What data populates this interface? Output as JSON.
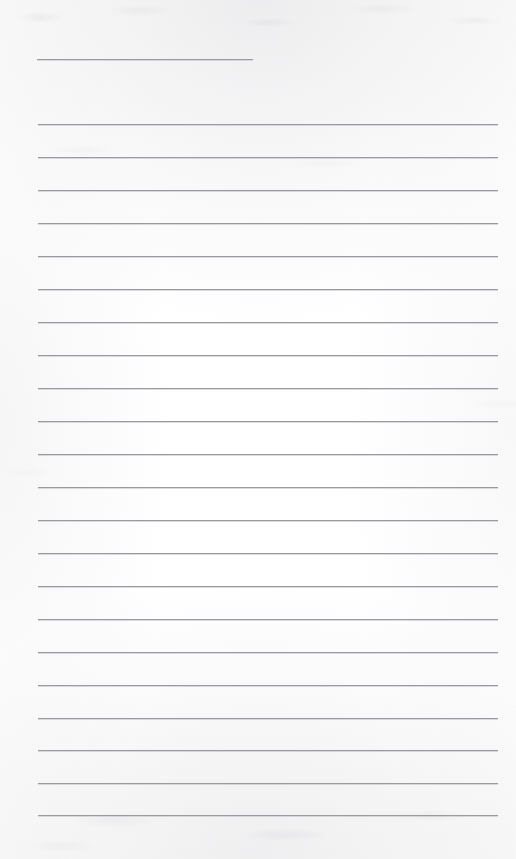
{
  "document": {
    "kind": "scanned-lined-paper",
    "title": "Blank ruled notepaper scan",
    "text_content": "",
    "handwriting": "none",
    "page_width": 516,
    "page_height": 859,
    "background_color": "#fdfdfc",
    "rule_color": "#9a9a9f",
    "rule_thickness_px": 1
  },
  "layout": {
    "left_margin_x": 38,
    "right_margin_x": 498,
    "top_margin_height": 59,
    "bottom_margin_height": 44,
    "line_spacing_px": 33,
    "full_width_line_count": 22,
    "short_line_count": 1
  },
  "rules": {
    "short": [
      {
        "x": 37,
        "y": 59,
        "width": 216
      }
    ],
    "full": [
      {
        "x": 38,
        "y": 124,
        "width": 460
      },
      {
        "x": 38,
        "y": 157,
        "width": 460
      },
      {
        "x": 38,
        "y": 190,
        "width": 460
      },
      {
        "x": 38,
        "y": 223,
        "width": 460
      },
      {
        "x": 38,
        "y": 256,
        "width": 460
      },
      {
        "x": 38,
        "y": 289,
        "width": 460
      },
      {
        "x": 38,
        "y": 322,
        "width": 460
      },
      {
        "x": 38,
        "y": 355,
        "width": 460
      },
      {
        "x": 38,
        "y": 388,
        "width": 460
      },
      {
        "x": 38,
        "y": 421,
        "width": 460
      },
      {
        "x": 38,
        "y": 454,
        "width": 460
      },
      {
        "x": 38,
        "y": 487,
        "width": 460
      },
      {
        "x": 38,
        "y": 520,
        "width": 460
      },
      {
        "x": 38,
        "y": 553,
        "width": 460
      },
      {
        "x": 38,
        "y": 586,
        "width": 460
      },
      {
        "x": 38,
        "y": 619,
        "width": 460
      },
      {
        "x": 38,
        "y": 652,
        "width": 460
      },
      {
        "x": 38,
        "y": 685,
        "width": 460
      },
      {
        "x": 38,
        "y": 718,
        "width": 460
      },
      {
        "x": 38,
        "y": 750,
        "width": 460
      },
      {
        "x": 38,
        "y": 783,
        "width": 460
      },
      {
        "x": 38,
        "y": 815,
        "width": 460
      }
    ]
  }
}
